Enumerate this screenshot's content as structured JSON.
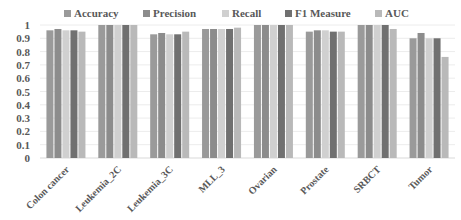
{
  "chart_data": {
    "type": "bar",
    "title": "",
    "xlabel": "",
    "ylabel": "",
    "ylim": [
      0,
      1
    ],
    "yticks": [
      "0",
      "0.1",
      "0.2",
      "0.3",
      "0.4",
      "0.5",
      "0.6",
      "0.7",
      "0.8",
      "0.9",
      "1"
    ],
    "grid": true,
    "legend_position": "top",
    "categories": [
      "Colon cancer",
      "Leukemia_2C",
      "Leukemia_3C",
      "MLL_3",
      "Ovarian",
      "Prostate",
      "SRBCT",
      "Tumor"
    ],
    "series": [
      {
        "name": "Accuracy",
        "color": "#9a9a9a",
        "values": [
          0.96,
          1.0,
          0.93,
          0.97,
          1.0,
          0.95,
          1.0,
          0.9
        ]
      },
      {
        "name": "Precision",
        "color": "#8c8c8c",
        "values": [
          0.97,
          1.0,
          0.94,
          0.97,
          1.0,
          0.96,
          1.0,
          0.94
        ]
      },
      {
        "name": "Recall",
        "color": "#d0d0d0",
        "values": [
          0.96,
          1.0,
          0.93,
          0.97,
          1.0,
          0.96,
          1.0,
          0.9
        ]
      },
      {
        "name": "F1 Measure",
        "color": "#707070",
        "values": [
          0.96,
          1.0,
          0.93,
          0.97,
          1.0,
          0.95,
          1.0,
          0.9
        ]
      },
      {
        "name": "AUC",
        "color": "#b9b9b9",
        "values": [
          0.95,
          1.0,
          0.95,
          0.98,
          1.0,
          0.95,
          0.97,
          0.76
        ]
      }
    ]
  }
}
